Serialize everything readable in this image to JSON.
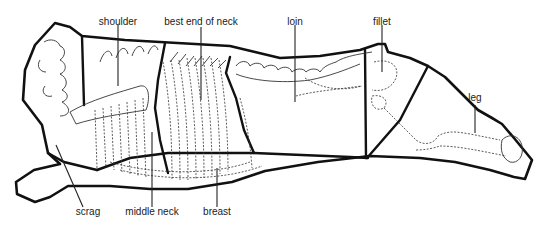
{
  "diagram": {
    "labels": {
      "shoulder": "shoulder",
      "best_end_of_neck": "best end of neck",
      "loin": "loin",
      "fillet": "fillet",
      "leg": "leg",
      "scrag": "scrag",
      "middle_neck": "middle neck",
      "breast": "breast"
    },
    "colors": {
      "background": "#ffffff",
      "line": "#111111",
      "text": "#1a1a1a"
    }
  }
}
